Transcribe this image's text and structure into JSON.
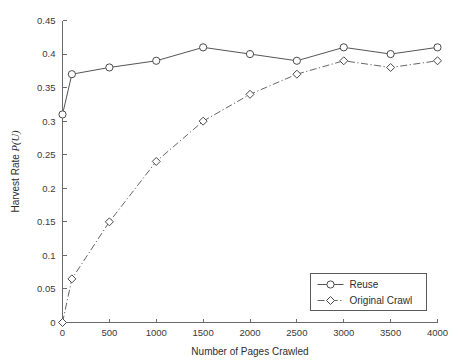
{
  "chart_data": {
    "type": "line",
    "title": "",
    "xlabel": "Number of Pages Crawled",
    "ylabel": "Harvest Rate ",
    "ylabel_italic": "P(U)",
    "xlim": [
      0,
      4000
    ],
    "ylim": [
      0,
      0.45
    ],
    "grid": false,
    "legend_position": "lower right",
    "xticks": [
      0,
      500,
      1000,
      1500,
      2000,
      2500,
      3000,
      3500,
      4000
    ],
    "xtick_labels": [
      "0",
      "500",
      "1000",
      "1500",
      "2000",
      "2500",
      "3000",
      "3500",
      "4000"
    ],
    "yticks": [
      0,
      0.05,
      0.1,
      0.15,
      0.2,
      0.25,
      0.3,
      0.35,
      0.4,
      0.45
    ],
    "ytick_labels": [
      "0",
      "0.05",
      "0.1",
      "0.15",
      "0.2",
      "0.25",
      "0.3",
      "0.35",
      "0.4",
      "0.45"
    ],
    "x": [
      0,
      100,
      500,
      1000,
      1500,
      2000,
      2500,
      3000,
      3500,
      4000
    ],
    "series": [
      {
        "name": "Reuse",
        "marker": "circle",
        "linestyle": "solid",
        "color": "#555555",
        "values": [
          0.31,
          0.37,
          0.38,
          0.39,
          0.41,
          0.4,
          0.39,
          0.41,
          0.4,
          0.41
        ]
      },
      {
        "name": "Original Crawl",
        "marker": "diamond",
        "linestyle": "dash-dot",
        "color": "#666666",
        "values": [
          0.0,
          0.065,
          0.15,
          0.24,
          0.3,
          0.34,
          0.37,
          0.39,
          0.38,
          0.39
        ]
      }
    ]
  },
  "legend": {
    "entries": [
      {
        "label": "Reuse"
      },
      {
        "label": "Original Crawl"
      }
    ]
  }
}
